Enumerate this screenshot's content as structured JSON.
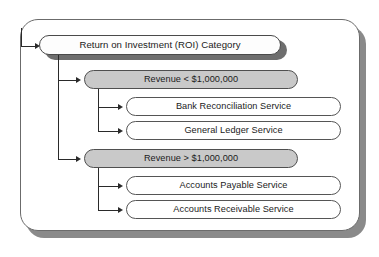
{
  "diagram": {
    "root": {
      "label": "Return on Investment (ROI) Category"
    },
    "categories": [
      {
        "label": "Revenue < $1,000,000",
        "services": [
          {
            "label": "Bank Reconciliation Service"
          },
          {
            "label": "General Ledger Service"
          }
        ]
      },
      {
        "label": "Revenue > $1,000,000",
        "services": [
          {
            "label": "Accounts Payable Service"
          },
          {
            "label": "Accounts Receivable Service"
          }
        ]
      }
    ],
    "colors": {
      "category_fill": "#c9c9c9",
      "node_fill": "#ffffff",
      "node_border": "#555555",
      "shadow": "#6e6e6e",
      "outer_shadow": "#8a8a8a",
      "connector": "#2a2a2a",
      "text": "#1b1b1b"
    }
  }
}
